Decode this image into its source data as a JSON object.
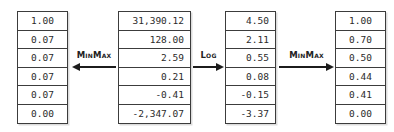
{
  "diagram": {
    "type": "transformation-pipeline",
    "columns": [
      {
        "id": "col-1",
        "name": "minmax-of-raw-values",
        "align": "center",
        "values": [
          "1.00",
          "0.07",
          "0.07",
          "0.07",
          "0.07",
          "0.00"
        ]
      },
      {
        "id": "col-2",
        "name": "raw-values",
        "align": "right",
        "values": [
          "31,390.12",
          "128.00",
          "2.59",
          "0.21",
          "-0.41",
          "-2,347.07"
        ]
      },
      {
        "id": "col-3",
        "name": "log-transformed-values",
        "align": "right",
        "values": [
          "4.50",
          "2.11",
          "0.55",
          "0.08",
          "-0.15",
          "-3.37"
        ]
      },
      {
        "id": "col-4",
        "name": "minmax-of-log-values",
        "align": "center",
        "values": [
          "1.00",
          "0.70",
          "0.50",
          "0.44",
          "0.41",
          "0.00"
        ]
      }
    ],
    "operations": [
      {
        "id": "op-1",
        "label": "MinMax",
        "direction": "left"
      },
      {
        "id": "op-2",
        "label": "Log",
        "direction": "right"
      },
      {
        "id": "op-3",
        "label": "MinMax",
        "direction": "right"
      }
    ]
  }
}
